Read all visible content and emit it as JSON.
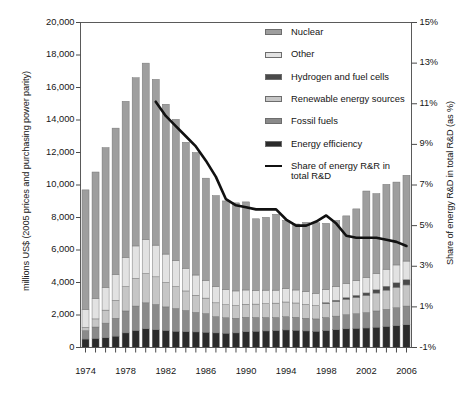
{
  "chart_data": {
    "type": "bar",
    "subtype": "stacked-bar-with-line",
    "title": "",
    "xlabel": "",
    "ylabel": "millions US$ (2005 prices and purchasing power parity)",
    "y2label": "Share of energy R&D in total R&D (as %)",
    "ylim": [
      0,
      20000
    ],
    "y2lim": [
      -1,
      15
    ],
    "grid": false,
    "legend_position": "top-right-inside",
    "categories": [
      1974,
      1975,
      1976,
      1977,
      1978,
      1979,
      1980,
      1981,
      1982,
      1983,
      1984,
      1985,
      1986,
      1987,
      1988,
      1989,
      1990,
      1991,
      1992,
      1993,
      1994,
      1995,
      1996,
      1997,
      1998,
      1999,
      2000,
      2001,
      2002,
      2003,
      2004,
      2005,
      2006
    ],
    "x_tick_labels": [
      "1974",
      "1978",
      "1982",
      "1986",
      "1990",
      "1994",
      "1998",
      "2002",
      "2006"
    ],
    "y_tick_labels": [
      "0",
      "2,000",
      "4,000",
      "6,000",
      "8,000",
      "10,000",
      "12,000",
      "14,000",
      "16,000",
      "18,000",
      "20,000"
    ],
    "y2_tick_labels": [
      "-1%",
      "1%",
      "3%",
      "5%",
      "7%",
      "9%",
      "11%",
      "13%",
      "15%"
    ],
    "series": [
      {
        "name": "Energy efficiency",
        "color": "#2b2b2b",
        "values": [
          520,
          560,
          600,
          700,
          900,
          1050,
          1150,
          1100,
          1050,
          1000,
          980,
          960,
          940,
          900,
          880,
          900,
          980,
          1000,
          1020,
          1050,
          1080,
          1060,
          1020,
          1000,
          1050,
          1100,
          1150,
          1180,
          1200,
          1250,
          1300,
          1350,
          1400
        ]
      },
      {
        "name": "Fossil fuels",
        "color": "#8a8a8a",
        "values": [
          520,
          700,
          900,
          1100,
          1350,
          1500,
          1600,
          1550,
          1450,
          1400,
          1300,
          1200,
          1150,
          1000,
          950,
          900,
          880,
          850,
          830,
          800,
          820,
          800,
          780,
          760,
          800,
          830,
          870,
          900,
          950,
          1000,
          1050,
          1100,
          1150
        ]
      },
      {
        "name": "Renewable energy sources",
        "color": "#c6c6c6",
        "values": [
          200,
          500,
          800,
          1100,
          1500,
          1700,
          1800,
          1700,
          1500,
          1350,
          1200,
          1050,
          950,
          850,
          800,
          780,
          800,
          820,
          850,
          880,
          900,
          880,
          850,
          820,
          850,
          900,
          950,
          1000,
          1050,
          1100,
          1180,
          1250,
          1300
        ]
      },
      {
        "name": "Hydrogen and fuel cells",
        "color": "#4a4a4a",
        "values": [
          0,
          0,
          0,
          0,
          0,
          0,
          0,
          0,
          0,
          0,
          0,
          0,
          0,
          0,
          0,
          0,
          0,
          0,
          0,
          0,
          0,
          0,
          0,
          0,
          60,
          80,
          100,
          130,
          160,
          200,
          240,
          280,
          320
        ]
      },
      {
        "name": "Other",
        "color": "#e2e2e2",
        "values": [
          1100,
          1250,
          1400,
          1600,
          1800,
          2000,
          2100,
          1950,
          1750,
          1600,
          1400,
          1250,
          1100,
          1000,
          950,
          900,
          880,
          850,
          830,
          800,
          820,
          800,
          780,
          760,
          800,
          830,
          870,
          900,
          950,
          1000,
          1050,
          1100,
          1150
        ]
      },
      {
        "name": "Nuclear",
        "color": "#9e9e9e",
        "values": [
          7360,
          7790,
          8600,
          9000,
          9600,
          10350,
          10850,
          10200,
          9220,
          8690,
          7750,
          7540,
          6280,
          5600,
          5440,
          5420,
          5420,
          4400,
          4480,
          4670,
          4200,
          4060,
          4270,
          4340,
          4080,
          4080,
          4160,
          4420,
          5320,
          4920,
          5220,
          5100,
          5280
        ]
      }
    ],
    "totals": [
      9700,
      10800,
      11300,
      13500,
      15150,
      16600,
      17500,
      16500,
      14970,
      14040,
      13810,
      13400,
      12130,
      10430,
      10000,
      9980,
      9990,
      8630,
      8700,
      8890,
      8210,
      7910,
      7990,
      8100,
      7960,
      7900,
      8100,
      8500,
      9500,
      9400,
      9500,
      9500,
      10000
    ],
    "line": {
      "name": "Share of energy R&R in total R&D",
      "color": "#111111",
      "x": [
        1981,
        1982,
        1983,
        1984,
        1985,
        1986,
        1987,
        1988,
        1989,
        1990,
        1991,
        1992,
        1993,
        1994,
        1995,
        1996,
        1997,
        1998,
        1999,
        2000,
        2001,
        2002,
        2003,
        2004,
        2005,
        2006
      ],
      "values": [
        11.1,
        10.4,
        9.9,
        9.4,
        8.9,
        8.2,
        7.4,
        6.3,
        6.0,
        5.9,
        5.8,
        5.8,
        5.8,
        5.3,
        5.0,
        5.0,
        5.2,
        5.5,
        5.1,
        4.5,
        4.4,
        4.4,
        4.4,
        4.3,
        4.2,
        4.0
      ]
    },
    "legend": [
      {
        "label": "Nuclear",
        "swatch": "#9e9e9e",
        "kind": "box"
      },
      {
        "label": "Other",
        "swatch": "#e2e2e2",
        "kind": "box"
      },
      {
        "label": "Hydrogen and fuel cells",
        "swatch": "#4a4a4a",
        "kind": "box"
      },
      {
        "label": "Renewable energy sources",
        "swatch": "#c6c6c6",
        "kind": "box"
      },
      {
        "label": "Fossil fuels",
        "swatch": "#8a8a8a",
        "kind": "box"
      },
      {
        "label": "Energy efficiency",
        "swatch": "#2b2b2b",
        "kind": "box"
      },
      {
        "label": "Share of energy R&R in total R&D",
        "swatch": "#111111",
        "kind": "line"
      }
    ]
  },
  "axes": {
    "left_title": "millions US$ (2005 prices and purchasing power parity)",
    "right_title": "Share of energy R&D in total R&D (as %)"
  }
}
